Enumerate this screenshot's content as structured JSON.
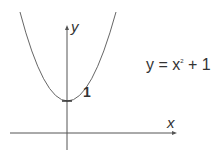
{
  "diagram": {
    "equation": {
      "lhs": "y = x",
      "exponent": "2",
      "rhs": "+ 1"
    },
    "axes": {
      "x_label": "x",
      "y_label": "y"
    },
    "annotations": {
      "y_intercept": "1"
    },
    "curve": {
      "function": "y = x^2 + 1",
      "vertex": [
        0,
        1
      ]
    }
  }
}
